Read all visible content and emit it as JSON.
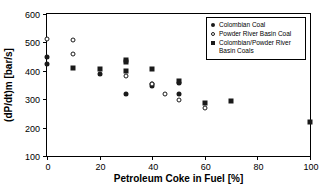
{
  "chart_data": {
    "type": "scatter",
    "title": "",
    "xlabel": "Petroleum Coke in Fuel [%]",
    "ylabel": "(dP/dt)m [bar/s]",
    "xlim": [
      0,
      100
    ],
    "ylim": [
      100,
      600
    ],
    "xticks": [
      0,
      20,
      40,
      60,
      80,
      100
    ],
    "yticks": [
      100,
      200,
      300,
      400,
      500,
      600
    ],
    "xtick_labels": [
      "0",
      "20",
      "40",
      "60",
      "80",
      "100"
    ],
    "ytick_labels": [
      "100",
      "200",
      "300",
      "400",
      "500",
      "600"
    ],
    "grid": false,
    "legend_position": "top-right",
    "series": [
      {
        "name": "Colombian Coal",
        "marker": "filled-circle",
        "color": "#1a1a1a",
        "points": [
          {
            "x": 0,
            "y": 450
          },
          {
            "x": 0,
            "y": 425
          },
          {
            "x": 20,
            "y": 388
          },
          {
            "x": 30,
            "y": 317
          },
          {
            "x": 40,
            "y": 352
          },
          {
            "x": 40,
            "y": 347
          },
          {
            "x": 50,
            "y": 356
          },
          {
            "x": 50,
            "y": 317
          }
        ]
      },
      {
        "name": "Powder River Basin Coal",
        "marker": "open-circle",
        "color": "#1a1a1a",
        "points": [
          {
            "x": 0,
            "y": 512
          },
          {
            "x": 10,
            "y": 510
          },
          {
            "x": 10,
            "y": 458
          },
          {
            "x": 30,
            "y": 380
          },
          {
            "x": 40,
            "y": 352
          },
          {
            "x": 45,
            "y": 318
          },
          {
            "x": 50,
            "y": 297
          },
          {
            "x": 60,
            "y": 270
          }
        ]
      },
      {
        "name": "Colombian/Powder River Basin Coals",
        "marker": "filled-square",
        "color": "#1a1a1a",
        "points": [
          {
            "x": 10,
            "y": 410
          },
          {
            "x": 20,
            "y": 408
          },
          {
            "x": 30,
            "y": 437
          },
          {
            "x": 30,
            "y": 430
          },
          {
            "x": 30,
            "y": 400
          },
          {
            "x": 40,
            "y": 408
          },
          {
            "x": 50,
            "y": 363
          },
          {
            "x": 60,
            "y": 285
          },
          {
            "x": 70,
            "y": 292
          },
          {
            "x": 100,
            "y": 218
          }
        ]
      }
    ],
    "legend_entries": [
      {
        "label": "Colombian Coal",
        "marker": "filled-circle"
      },
      {
        "label": "Powder River Basin Coal",
        "marker": "open-circle"
      },
      {
        "label": "Colombian/Powder River Basin Coals",
        "marker": "filled-square"
      }
    ]
  }
}
